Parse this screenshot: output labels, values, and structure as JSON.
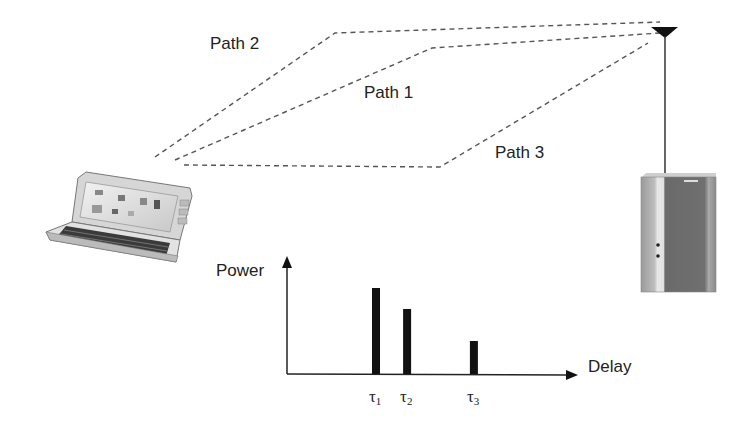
{
  "diagram": {
    "paths": [
      {
        "id": "path-1",
        "label": "Path 1"
      },
      {
        "id": "path-2",
        "label": "Path 2"
      },
      {
        "id": "path-3",
        "label": "Path 3"
      }
    ],
    "devices": {
      "mobile": "handheld-laptop",
      "base_station": "base-station-cabinet",
      "antenna": "antenna"
    },
    "colors": {
      "line": "#555555",
      "bar": "#111111",
      "text": "#222222",
      "cabinet": "#6e6e6e"
    }
  },
  "chart_data": {
    "type": "bar",
    "title": "",
    "ylabel": "Power",
    "xlabel": "Delay",
    "categories": [
      "τ1",
      "τ2",
      "τ3"
    ],
    "tick_labels": [
      {
        "base": "τ",
        "sub": "1"
      },
      {
        "base": "τ",
        "sub": "2"
      },
      {
        "base": "τ",
        "sub": "3"
      }
    ],
    "x": [
      1.0,
      1.7,
      3.2
    ],
    "values": [
      0.86,
      0.65,
      0.33
    ],
    "xlim": [
      -1.0,
      8.0
    ],
    "ylim": [
      0,
      1.0
    ],
    "grid": false,
    "legend": "none"
  }
}
